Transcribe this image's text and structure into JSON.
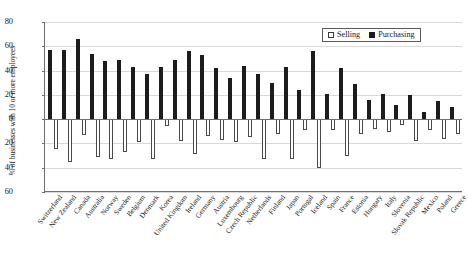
{
  "chart_data": {
    "type": "bar",
    "title": "",
    "xlabel": "",
    "ylabel": "% of businesses with 10 or more employees",
    "ylim": [
      -60,
      80
    ],
    "yticks": [
      80,
      60,
      40,
      20,
      0,
      20,
      40,
      60
    ],
    "grid": true,
    "legend_position": "top-right",
    "note": "Selling values are plotted downward (negative direction); magnitudes listed as negative numbers.",
    "categories": [
      "Switzerland",
      "New Zealand",
      "Canada",
      "Australia",
      "Norway",
      "Sweden",
      "Belgium",
      "Denmark",
      "Korea",
      "United Kingdom",
      "Ireland",
      "Germany",
      "Austria",
      "Luxembourg",
      "Czech Republic",
      "Netherlands",
      "Finland",
      "Japan",
      "Portugal",
      "Iceland",
      "Spain",
      "France",
      "Estonia",
      "Hungary",
      "Italy",
      "Slovenia",
      "Slovak Republic",
      "Mexico",
      "Poland",
      "Greece"
    ],
    "series": [
      {
        "name": "Purchasing",
        "color": "#1c1c1c",
        "values": [
          57,
          57,
          66,
          54,
          48,
          49,
          43,
          37,
          43,
          49,
          56,
          53,
          42,
          34,
          44,
          37,
          30,
          43,
          24,
          56,
          21,
          42,
          29,
          16,
          21,
          12,
          20,
          6,
          15,
          10
        ]
      },
      {
        "name": "Selling",
        "color": "#ffffff",
        "values": [
          -25,
          -35,
          -13,
          -31,
          -33,
          -27,
          -19,
          -33,
          -6,
          -18,
          -29,
          -14,
          -17,
          -19,
          -15,
          -33,
          -12,
          -33,
          -9,
          -40,
          -9,
          -30,
          -12,
          -8,
          -11,
          -5,
          -18,
          -9,
          -16,
          -12
        ]
      }
    ]
  },
  "legend": {
    "items": [
      {
        "label": "Selling",
        "swatch": "hollow-square"
      },
      {
        "label": "Purchasing",
        "swatch": "filled-square"
      }
    ]
  }
}
